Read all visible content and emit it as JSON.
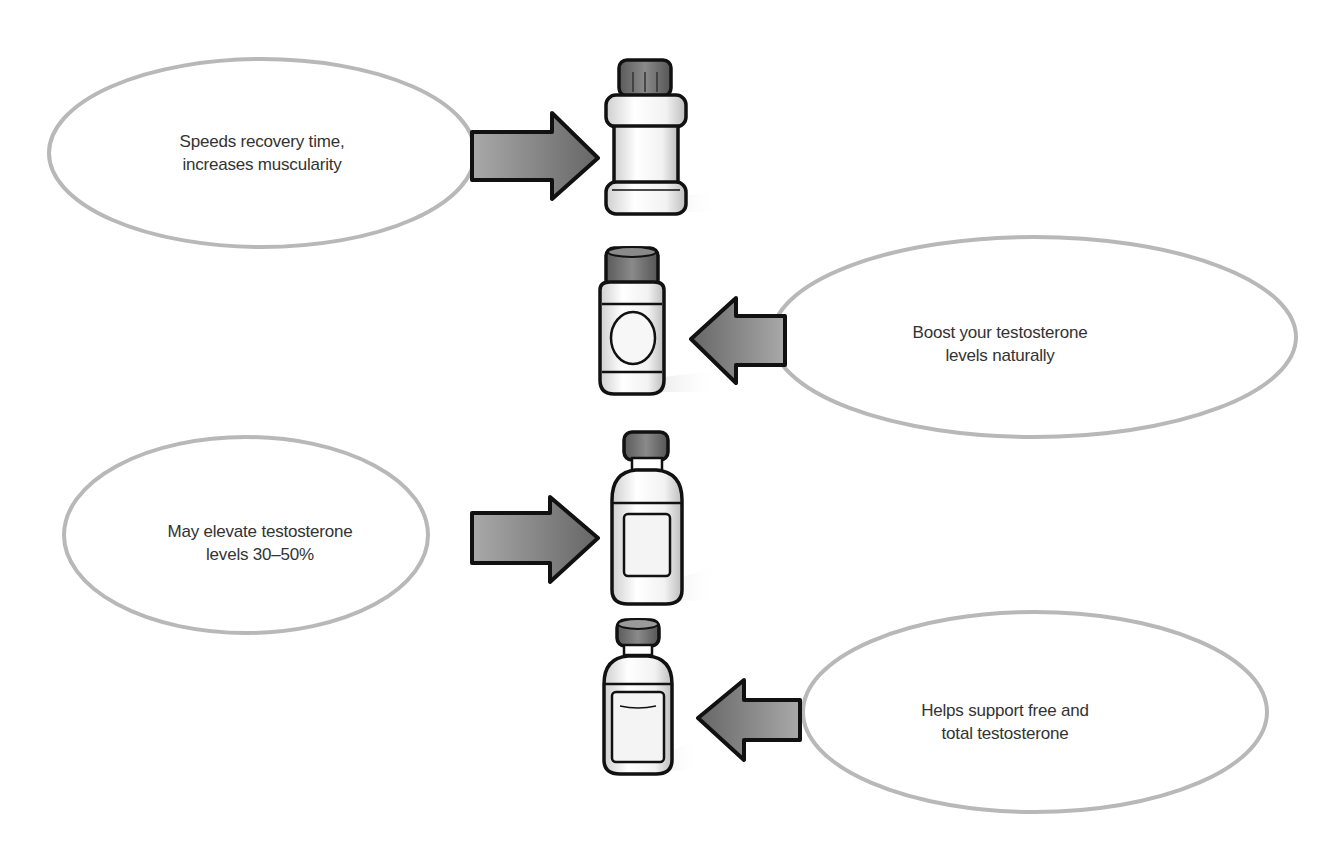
{
  "diagram": {
    "type": "supplement-claims",
    "colors": {
      "bubble_outline": "#b5b5b5",
      "arrow_fill_dark": "#6e6e6e",
      "arrow_fill_light": "#a9a9a9",
      "outline": "#111111",
      "cap": "#6b6b6b",
      "text": "#333333"
    },
    "items": [
      {
        "claim_line1": "Speeds recovery time,",
        "claim_line2": "increases muscularity",
        "bubble_side": "left",
        "arrow_direction": "right",
        "bottle": "wide-jar-bottle-icon"
      },
      {
        "claim_line1": "Boost your testosterone",
        "claim_line2": "levels naturally",
        "bubble_side": "right",
        "arrow_direction": "left",
        "bottle": "pill-jar-bottle-icon"
      },
      {
        "claim_line1": "May elevate testosterone",
        "claim_line2": "levels 30–50%",
        "bubble_side": "left",
        "arrow_direction": "right",
        "bottle": "labeled-bottle-icon"
      },
      {
        "claim_line1": "Helps support free and",
        "claim_line2": "total testosterone",
        "bubble_side": "right",
        "arrow_direction": "left",
        "bottle": "small-vial-bottle-icon"
      }
    ]
  }
}
